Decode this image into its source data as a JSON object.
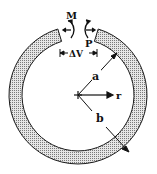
{
  "diagram": {
    "labels": {
      "moment": "M",
      "force": "P",
      "gap": "ΔV",
      "inner_radius": "a",
      "outer_radius": "b",
      "radial_coord": "r"
    },
    "geometry": {
      "center": [
        78,
        95
      ],
      "inner_radius_px": 56,
      "outer_radius_px": 69,
      "gap_half_angle_deg": 17
    },
    "colors": {
      "ring_fill": "#b8b8b8",
      "stroke": "#1a1a1a",
      "background": "#ffffff"
    }
  }
}
